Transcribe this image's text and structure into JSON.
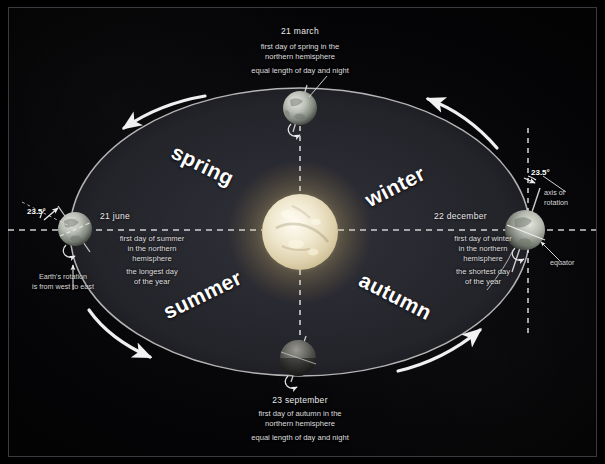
{
  "diagram": {
    "background_color": "#000000",
    "frame_border_color": "#3a3a40"
  },
  "sun": {
    "name": "Sun",
    "core_color": "#f3efe2",
    "glow_color": "#f2e4b0"
  },
  "orbit": {
    "ellipse_color": "#bdbdbd",
    "disc_color": "#2a2a30",
    "direction_note": "counter-clockwise"
  },
  "seasons": [
    {
      "label": "spring",
      "quadrant": "upper-left"
    },
    {
      "label": "winter",
      "quadrant": "upper-right"
    },
    {
      "label": "summer",
      "quadrant": "lower-left"
    },
    {
      "label": "autumn",
      "quadrant": "lower-right"
    }
  ],
  "positions": {
    "march": {
      "date": "21 march",
      "line1": "first day of spring in the\nnorthern hemisphere",
      "line2": "equal length of day and night"
    },
    "june": {
      "date": "21 june",
      "line1": "first day of summer\nin the northern\nhemisphere",
      "line2": "the longest day\nof the year"
    },
    "december": {
      "date": "22 december",
      "line1": "first day of winter\nin the northern\nhemisphere",
      "line2": "the shortest day\nof the year"
    },
    "september": {
      "date": "23 september",
      "line1": "first day of autumn in the\nnorthern hemisphere",
      "line2": "equal length of day and night"
    }
  },
  "annotations": {
    "tilt_left": "23.5°",
    "tilt_right": "23.5°",
    "rotation_note": "Earth's rotation\nis from west to east",
    "axis_of_rotation": "axis of\nrotation",
    "equator": "equator"
  }
}
